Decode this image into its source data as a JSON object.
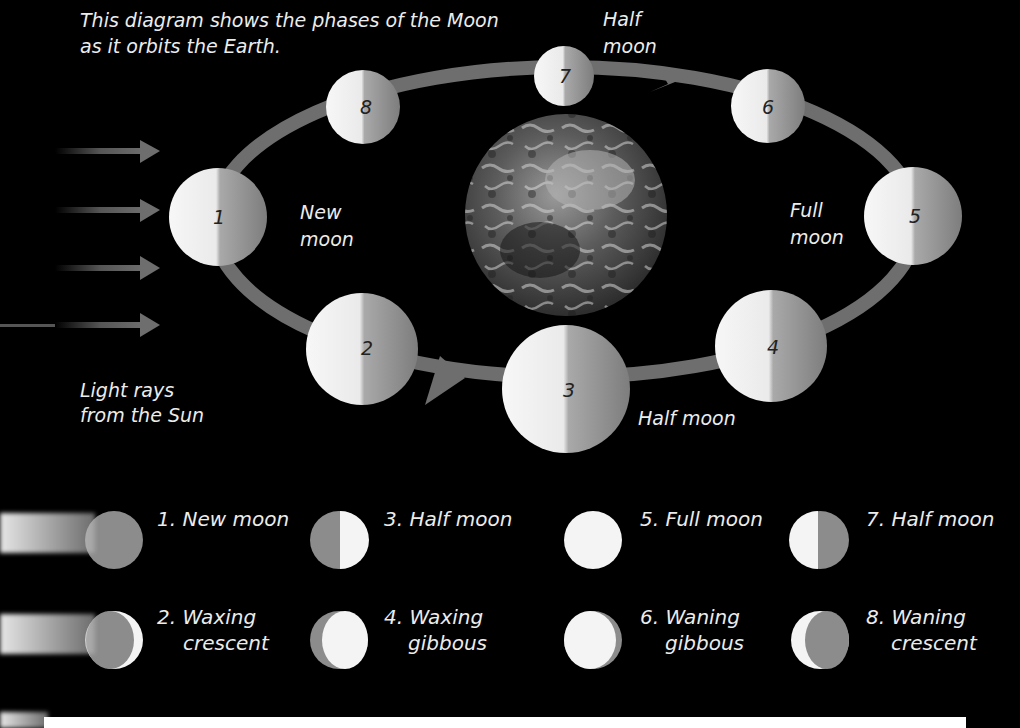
{
  "caption": {
    "line1": "This diagram shows the phases of the Moon",
    "line2": "as it orbits the Earth."
  },
  "light_rays_label": {
    "line1": "Light rays",
    "line2": "from the Sun"
  },
  "orbit_labels": {
    "new_moon": {
      "line1": "New",
      "line2": "moon"
    },
    "full_moon": {
      "line1": "Full",
      "line2": "moon"
    },
    "half_moon_top": {
      "line1": "Half",
      "line2": "moon"
    },
    "half_moon_bottom": "Half moon"
  },
  "orbit_moons": [
    {
      "num": "1"
    },
    {
      "num": "2"
    },
    {
      "num": "3"
    },
    {
      "num": "4"
    },
    {
      "num": "5"
    },
    {
      "num": "6"
    },
    {
      "num": "7"
    },
    {
      "num": "8"
    }
  ],
  "legend": [
    {
      "id": 1,
      "line1": "1. New moon",
      "line2": ""
    },
    {
      "id": 2,
      "line1": "2. Waxing",
      "line2": "crescent"
    },
    {
      "id": 3,
      "line1": "3. Half moon",
      "line2": ""
    },
    {
      "id": 4,
      "line1": "4. Waxing",
      "line2": "gibbous"
    },
    {
      "id": 5,
      "line1": "5. Full moon",
      "line2": ""
    },
    {
      "id": 6,
      "line1": "6. Waning",
      "line2": "gibbous"
    },
    {
      "id": 7,
      "line1": "7. Half moon",
      "line2": ""
    },
    {
      "id": 8,
      "line1": "8. Waning",
      "line2": "crescent"
    }
  ],
  "colors": {
    "background": "#000000",
    "orbit": "#6e6e6e",
    "moon_lit": "#f4f4f4",
    "moon_dark": "#8c8c8c",
    "text": "#ececec"
  }
}
